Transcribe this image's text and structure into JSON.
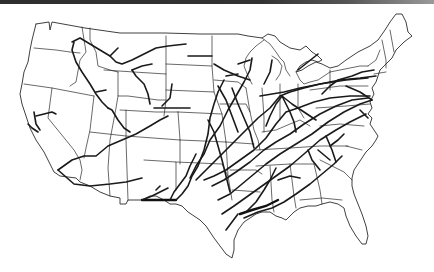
{
  "figure": {
    "subject": "Contiguous United States pipeline network map",
    "style": "black line art on white",
    "colors": {
      "background": "#ffffff",
      "lines": "#1a1a1a",
      "top_bar": "#333333"
    },
    "labels": []
  },
  "map": {
    "region": "contiguous-united-states",
    "layers": [
      {
        "name": "national-outline",
        "type": "outline"
      },
      {
        "name": "state-boundaries",
        "type": "borders"
      },
      {
        "name": "pipelines",
        "type": "routes"
      }
    ]
  }
}
